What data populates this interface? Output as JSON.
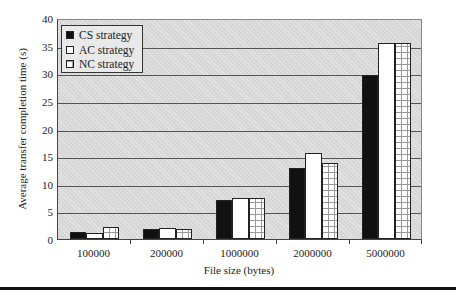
{
  "chart_data": {
    "type": "bar",
    "title": "",
    "xlabel": "File size (bytes)",
    "ylabel": "Average transfer completion time (s)",
    "categories": [
      "100000",
      "200000",
      "1000000",
      "2000000",
      "5000000"
    ],
    "series": [
      {
        "name": "CS strategy",
        "values": [
          1.2,
          1.9,
          7.1,
          12.8,
          29.6
        ]
      },
      {
        "name": "AC strategy",
        "values": [
          1.1,
          2.0,
          7.5,
          15.6,
          35.4
        ]
      },
      {
        "name": "NC strategy",
        "values": [
          2.1,
          1.9,
          7.5,
          13.8,
          35.4
        ]
      }
    ],
    "ylim": [
      0,
      40
    ],
    "yticks": [
      "0",
      "5",
      "10",
      "15",
      "20",
      "25",
      "30",
      "35",
      "40"
    ],
    "grid": true,
    "legend_position": "upper-left"
  },
  "colors": {
    "cs": "#111111",
    "ac": "#ffffff",
    "nc_pattern": "#999999",
    "plot_bg": "#d6d6d6"
  }
}
